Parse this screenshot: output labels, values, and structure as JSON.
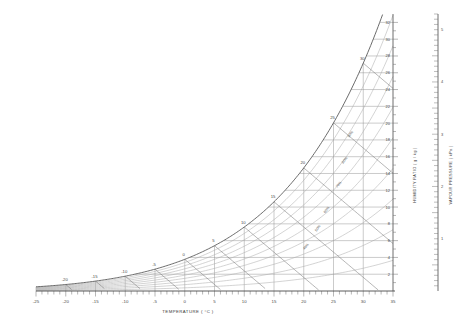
{
  "chart_data": {
    "type": "line",
    "title": "",
    "xlabel": "TEMPERATURE  ( °C )",
    "xlim": [
      -25,
      35
    ],
    "xticks": [
      -25,
      -20,
      -15,
      -10,
      -5,
      0,
      5,
      10,
      15,
      20,
      25,
      30,
      35
    ],
    "xtick_labels": [
      "-25",
      "-20",
      "-15",
      "-10",
      "-5",
      "0",
      "5",
      "10",
      "15",
      "20",
      "25",
      "30",
      "35"
    ],
    "xminor_step": 1,
    "grid": true,
    "legend": "none",
    "y_axes": [
      {
        "name": "humidity-ratio",
        "label": "HUMIDITY RATIO  ( g / kg )",
        "ylim": [
          0,
          33
        ],
        "ticks": [
          2,
          4,
          6,
          8,
          10,
          12,
          14,
          16,
          18,
          20,
          22,
          24,
          26,
          28,
          30,
          32
        ],
        "tick_labels": [
          "2",
          "4",
          "6",
          "8",
          "10",
          "12",
          "14",
          "16",
          "18",
          "20",
          "22",
          "24",
          "26",
          "28",
          "30",
          "32"
        ],
        "minor_step": 1
      },
      {
        "name": "vapour-pressure",
        "label": "VAPOUR PRESSURE  ( kPa )",
        "ylim": [
          0,
          5.3
        ],
        "ticks": [
          1,
          2,
          3,
          4,
          5
        ],
        "tick_labels": [
          "1",
          "2",
          "3",
          "4",
          "5"
        ],
        "minor_step": 0.1
      }
    ],
    "saturation_curve": {
      "name": "saturation-line-100-percent",
      "x": [
        -25,
        -20,
        -15,
        -10,
        -5,
        0,
        5,
        10,
        15,
        20,
        25,
        30,
        32
      ],
      "humidity_ratio": [
        0.4,
        0.63,
        1.01,
        1.6,
        2.5,
        3.8,
        5.4,
        7.6,
        10.6,
        14.7,
        20.2,
        27.2,
        30.8
      ]
    },
    "wet_bulb_labels": [
      "-20",
      "-15",
      "-10",
      "-5",
      "0",
      "5",
      "10",
      "15",
      "20",
      "25",
      "30"
    ],
    "wet_bulb_values": [
      -20,
      -15,
      -10,
      -5,
      0,
      5,
      10,
      15,
      20,
      25,
      30
    ],
    "relative_humidity_lines": {
      "label_suffix": "%",
      "values": [
        10,
        20,
        30,
        40,
        50,
        60,
        70,
        80,
        90
      ],
      "labels": [
        "10%",
        "20%",
        "30%",
        "40%",
        "50%",
        "60%",
        "70%",
        "80%",
        "90%"
      ]
    },
    "annotations": [
      {
        "text": "60%",
        "x": 24.0,
        "y": 9.6
      },
      {
        "text": "50%",
        "x": 22.5,
        "y": 7.4
      },
      {
        "text": "40%",
        "x": 20.5,
        "y": 5.2
      },
      {
        "text": "80%",
        "x": 27.0,
        "y": 15.5
      },
      {
        "text": "70%",
        "x": 26.0,
        "y": 12.6
      },
      {
        "text": "90%",
        "x": 28.0,
        "y": 18.6
      }
    ]
  },
  "axis_text": {
    "x_label": "TEMPERATURE  ( °C )",
    "degree_unit": "°C",
    "humidity_label": "HUMIDITY RATIO  ( g / kg )",
    "pressure_label": "VAPOUR PRESSURE  ( kPa )"
  }
}
